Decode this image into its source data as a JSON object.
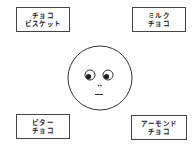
{
  "diagram": {
    "center": {
      "type": "face",
      "expression": "looking-down-left, neutral mouth"
    },
    "options": [
      {
        "position": "top-left",
        "line1": "チョコ",
        "line2": "ビスケット"
      },
      {
        "position": "top-right",
        "line1": "ミルク",
        "line2": "チョコ"
      },
      {
        "position": "bottom-left",
        "line1": "ビター",
        "line2": "チョコ"
      },
      {
        "position": "bottom-right",
        "line1": "アーモンド",
        "line2": "チョコ"
      }
    ]
  }
}
